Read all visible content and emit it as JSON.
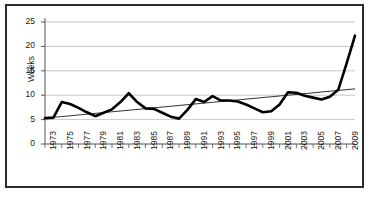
{
  "chart_data": {
    "type": "line",
    "title": "",
    "xlabel": "",
    "ylabel": "Weeks",
    "ylim": [
      0,
      25
    ],
    "ytick_values": [
      0,
      5,
      10,
      15,
      20,
      25
    ],
    "ytick_labels": [
      "0",
      "5",
      "10",
      "15",
      "20",
      "25"
    ],
    "grid": true,
    "legend": "none",
    "xlim": [
      1973,
      2010
    ],
    "x": [
      1973,
      1974,
      1975,
      1976,
      1977,
      1978,
      1979,
      1980,
      1981,
      1982,
      1983,
      1984,
      1985,
      1986,
      1987,
      1988,
      1989,
      1990,
      1991,
      1992,
      1993,
      1994,
      1995,
      1996,
      1997,
      1998,
      1999,
      2000,
      2001,
      2002,
      2003,
      2004,
      2005,
      2006,
      2007,
      2008,
      2009,
      2010
    ],
    "xtick_labels": [
      "1973",
      "1975",
      "1977",
      "1979",
      "1981",
      "1983",
      "1985",
      "1987",
      "1989",
      "1991",
      "1993",
      "1995",
      "1997",
      "1999",
      "2001",
      "2003",
      "2005",
      "2007",
      "2009"
    ],
    "xtick_values": [
      1973,
      1975,
      1977,
      1979,
      1981,
      1983,
      1985,
      1987,
      1989,
      1991,
      1993,
      1995,
      1997,
      1999,
      2001,
      2003,
      2005,
      2007,
      2009
    ],
    "series": [
      {
        "name": "Weeks",
        "color": "#000000",
        "width": 2.6,
        "values": [
          5.3,
          5.4,
          8.6,
          8.2,
          7.4,
          6.5,
          5.7,
          6.4,
          7.1,
          8.6,
          10.4,
          8.6,
          7.3,
          7.2,
          6.4,
          5.6,
          5.2,
          7.0,
          9.2,
          8.6,
          9.8,
          8.9,
          8.9,
          8.7,
          8.1,
          7.3,
          6.5,
          6.7,
          8.1,
          10.6,
          10.5,
          9.9,
          9.5,
          9.1,
          9.7,
          11.1,
          16.5,
          22.2
        ]
      },
      {
        "name": "Linear trend",
        "color": "#000000",
        "width": 0.8,
        "type": "trendline",
        "start": [
          1973,
          5.3
        ],
        "end": [
          2010,
          11.3
        ]
      }
    ]
  },
  "caption": ""
}
